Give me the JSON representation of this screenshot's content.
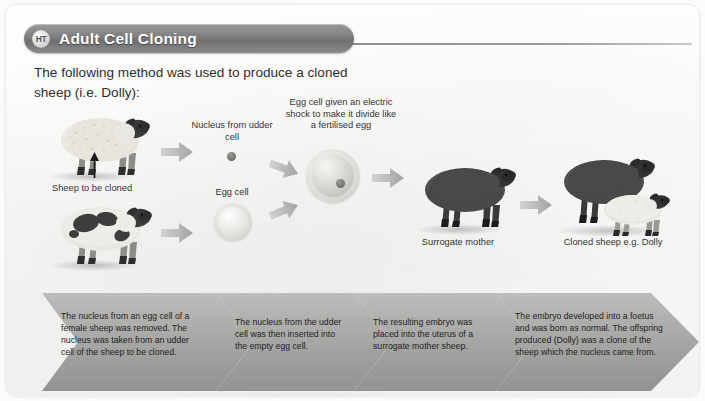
{
  "header": {
    "badge": "HT",
    "title": "Adult Cell Cloning"
  },
  "intro": "The following method was used to produce a cloned sheep (i.e. Dolly):",
  "diagram_labels": {
    "sheep_to_be_cloned": "Sheep to be cloned",
    "nucleus_from_udder_cell": "Nucleus from udder cell",
    "egg_cell": "Egg cell",
    "electric_shock": "Egg cell given an electric shock to make it divide like a fertilised egg",
    "surrogate_mother": "Surrogate mother",
    "cloned_sheep": "Cloned sheep e.g. Dolly"
  },
  "steps": [
    {
      "id": "step-1",
      "text": "The nucleus from an egg cell of a female sheep was removed. The nucleus was taken from an udder cell of the sheep to be cloned."
    },
    {
      "id": "step-2",
      "text": "The nucleus from the udder cell was then inserted into the empty egg cell."
    },
    {
      "id": "step-3",
      "text": "The resulting embryo was placed into the uterus of a surrogate mother sheep."
    },
    {
      "id": "step-4",
      "text": "The embryo developed into a foetus and was born as normal. The offspring produced (Dolly) was a clone of the sheep which the nucleus came from."
    }
  ],
  "colors": {
    "pill_grey": "#808080",
    "banner_grey": "#9e9e9e",
    "arrow_grey": "#b0b0b0",
    "page_bg": "#fcfcfb",
    "text": "#2e2e2e",
    "sheep_white_fleece": "#e8e6e0",
    "sheep_dark": "#4a4a4a",
    "sheep_face_dark": "#2f2f2f"
  }
}
